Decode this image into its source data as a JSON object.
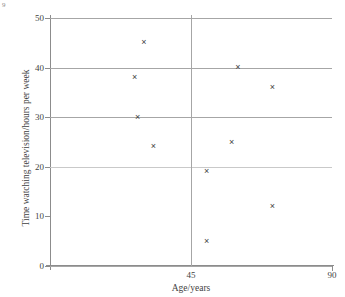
{
  "corner_mark": "9",
  "chart_data": {
    "type": "scatter",
    "title": "",
    "xlabel": "Age/years",
    "ylabel": "Time watching television/hours per week",
    "xlim": [
      0,
      90
    ],
    "ylim": [
      0,
      50
    ],
    "x_ticks": [
      {
        "value": 45,
        "label": "45"
      },
      {
        "value": 90,
        "label": "90"
      }
    ],
    "y_ticks": [
      {
        "value": 0,
        "label": "0",
        "grid": true
      },
      {
        "value": 10,
        "label": "10",
        "grid": false
      },
      {
        "value": 20,
        "label": "20",
        "grid": true
      },
      {
        "value": 30,
        "label": "30",
        "grid": true
      },
      {
        "value": 40,
        "label": "40",
        "grid": true
      },
      {
        "value": 50,
        "label": "50",
        "grid": true
      }
    ],
    "grid": true,
    "legend": null,
    "marker": "x",
    "points": [
      {
        "x": 30,
        "y": 45
      },
      {
        "x": 27,
        "y": 38
      },
      {
        "x": 28,
        "y": 30
      },
      {
        "x": 33,
        "y": 24
      },
      {
        "x": 60,
        "y": 40
      },
      {
        "x": 71,
        "y": 36
      },
      {
        "x": 58,
        "y": 25
      },
      {
        "x": 50,
        "y": 19
      },
      {
        "x": 71,
        "y": 12
      },
      {
        "x": 50,
        "y": 5
      }
    ]
  }
}
